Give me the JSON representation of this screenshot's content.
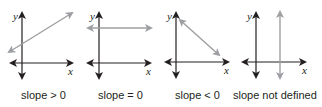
{
  "diagram": {
    "colors": {
      "axis": "#231f20",
      "line": "#9d9fa2",
      "text": "#231f20"
    },
    "panels": [
      {
        "id": "positive",
        "caption": "slope > 0",
        "x_label": "x",
        "y_label": "y",
        "line_orientation": "rising"
      },
      {
        "id": "zero",
        "caption": "slope = 0",
        "x_label": "x",
        "y_label": "y",
        "line_orientation": "horizontal"
      },
      {
        "id": "negative",
        "caption": "slope < 0",
        "x_label": "x",
        "y_label": "y",
        "line_orientation": "falling"
      },
      {
        "id": "undefined",
        "caption": "slope not defined",
        "x_label": "x",
        "y_label": "y",
        "line_orientation": "vertical"
      }
    ]
  }
}
